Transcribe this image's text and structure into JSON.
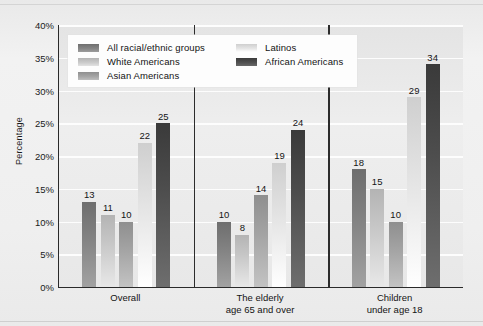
{
  "chart_data": {
    "type": "bar",
    "title": "",
    "xlabel": "",
    "ylabel": "Percentage",
    "ylim": [
      0,
      40
    ],
    "ytick_labels": [
      "0%",
      "5%",
      "10%",
      "15%",
      "20%",
      "25%",
      "30%",
      "35%",
      "40%"
    ],
    "ytick_values": [
      0,
      5,
      10,
      15,
      20,
      25,
      30,
      35,
      40
    ],
    "grid": true,
    "legend_position": "top-left-inside",
    "categories": [
      "Overall",
      "The elderly\nage 65 and over",
      "Children\nunder age 18"
    ],
    "category_lines": [
      [
        "Overall"
      ],
      [
        "The elderly",
        "age 65 and over"
      ],
      [
        "Children",
        "under age 18"
      ]
    ],
    "series": [
      {
        "name": "All racial/ethnic groups",
        "color": "#6e6e6e",
        "values": [
          13,
          10,
          18
        ]
      },
      {
        "name": "White Americans",
        "color": "#b4b4b4",
        "values": [
          11,
          8,
          15
        ]
      },
      {
        "name": "Asian Americans",
        "color": "#8f8f8f",
        "values": [
          10,
          14,
          10
        ]
      },
      {
        "name": "Latinos",
        "color": "#cfcfcf",
        "values": [
          22,
          19,
          29
        ]
      },
      {
        "name": "African Americans",
        "color": "#3a3a3a",
        "values": [
          25,
          24,
          34
        ]
      }
    ]
  },
  "colors": {
    "page_background": "#efefef",
    "plot_background": "#e8e8e8",
    "gridline": "#fdfdfd",
    "axis": "#2a2a2a",
    "text": "#141414",
    "legend_background": "#fdfdfd"
  }
}
